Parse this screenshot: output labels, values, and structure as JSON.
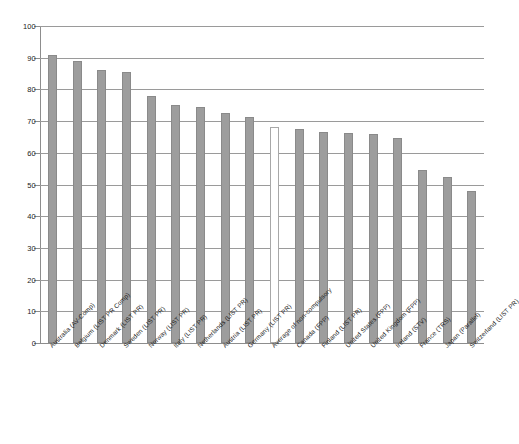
{
  "chart_data": {
    "type": "bar",
    "title": "",
    "subtitle": "",
    "xlabel": "",
    "ylabel": "",
    "ylim": [
      0,
      100
    ],
    "yticks": [
      0,
      10,
      20,
      30,
      40,
      50,
      60,
      70,
      80,
      90,
      100
    ],
    "grid": true,
    "legend": null,
    "legend_position": "none",
    "bar_color": "#9d9d9d",
    "bar_edge_color": "#8a8a8a",
    "highlight_color": "#ffffff",
    "gridline_color": "#9a9a9a",
    "axis_color": "#8d8d8d",
    "text_color": "#222222",
    "categories": [
      "Australia (AV-Comp)",
      "Belgium (LIST PR Comp)",
      "Denmark (LIST PR)",
      "Sweden (LIST PR)",
      "Norway (LIST PR)",
      "Italy (LIST PR)",
      "Netherlands (LIST PR)",
      "Austria (LIST PR)",
      "Germany (LIST PR)",
      "Average of non-compulsory",
      "Canada (FPP)",
      "Finland (LIST PR)",
      "United States (FPP)",
      "United Kingdom (FPP)",
      "Ireland (STV)",
      "France (TRS)",
      "Japan (Parallel)",
      "Switzerland (LIST PR)"
    ],
    "values": [
      91,
      89,
      86,
      85.5,
      78,
      75,
      74.5,
      72.5,
      71.2,
      68,
      67.5,
      66.5,
      66.3,
      66,
      64.8,
      54.5,
      52.4,
      48
    ],
    "series": [
      {
        "name": "Voter turnout",
        "values": [
          91,
          89,
          86,
          85.5,
          78,
          75,
          74.5,
          72.5,
          71.2,
          68,
          67.5,
          66.5,
          66.3,
          66,
          64.8,
          54.5,
          52.4,
          48
        ]
      }
    ],
    "highlight_indices": [
      9
    ],
    "annotations": []
  }
}
